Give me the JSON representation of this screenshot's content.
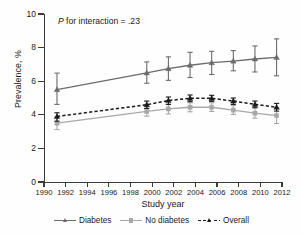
{
  "annotation": {
    "prefix": "P",
    "text": " for interaction = .23"
  },
  "legend": {
    "position": "bottom-center",
    "items": [
      {
        "label": "Diabetes",
        "color": "#6b6b6b",
        "dash": "solid",
        "marker": "triangle"
      },
      {
        "label": "No diabetes",
        "color": "#a8a8a8",
        "dash": "solid",
        "marker": "square"
      },
      {
        "label": "Overall",
        "color": "#1a1a1a",
        "dash": "dashed",
        "marker": "triangle"
      }
    ]
  },
  "chart_data": {
    "type": "line",
    "title": "",
    "xlabel": "Study year",
    "ylabel": "Prevalence, %",
    "xlim": [
      1990,
      2012
    ],
    "ylim": [
      0,
      10
    ],
    "xticks": [
      1990,
      1992,
      1994,
      1996,
      1998,
      2000,
      2002,
      2004,
      2006,
      2008,
      2010,
      2012
    ],
    "yticks": [
      0,
      2,
      4,
      6,
      8,
      10
    ],
    "grid": false,
    "errorbars": true,
    "annotations": [
      "P for interaction = .23"
    ],
    "x": [
      1991.2,
      1999.5,
      2001.5,
      2003.5,
      2005.5,
      2007.5,
      2009.5,
      2011.5
    ],
    "series": [
      {
        "name": "Diabetes",
        "color": "#6b6b6b",
        "dash": "solid",
        "marker": "triangle",
        "values": [
          5.5,
          6.5,
          6.75,
          6.95,
          7.1,
          7.2,
          7.32,
          7.42
        ],
        "ci_low": [
          4.62,
          5.88,
          6.05,
          6.22,
          6.4,
          6.62,
          6.55,
          6.32
        ],
        "ci_high": [
          6.48,
          7.15,
          7.45,
          7.72,
          7.78,
          7.82,
          8.1,
          8.52
        ]
      },
      {
        "name": "No diabetes",
        "color": "#a8a8a8",
        "dash": "solid",
        "marker": "square",
        "values": [
          3.5,
          4.2,
          4.35,
          4.45,
          4.45,
          4.28,
          4.1,
          3.95
        ],
        "ci_low": [
          3.12,
          3.92,
          4.05,
          4.18,
          4.2,
          4.02,
          3.8,
          3.48
        ],
        "ci_high": [
          3.88,
          4.5,
          4.62,
          4.72,
          4.72,
          4.55,
          4.42,
          4.42
        ]
      },
      {
        "name": "Overall",
        "color": "#1a1a1a",
        "dash": "dashed",
        "marker": "triangle",
        "values": [
          3.9,
          4.6,
          4.85,
          4.98,
          4.98,
          4.82,
          4.62,
          4.45
        ],
        "ci_low": [
          3.62,
          4.38,
          4.62,
          4.78,
          4.8,
          4.62,
          4.42,
          4.22
        ],
        "ci_high": [
          4.12,
          4.82,
          5.06,
          5.18,
          5.16,
          5.0,
          4.82,
          4.68
        ]
      }
    ]
  }
}
